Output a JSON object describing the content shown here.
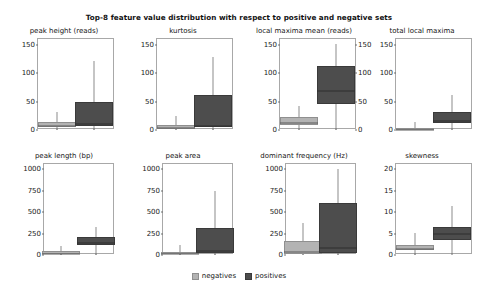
{
  "chart_data": {
    "type": "box",
    "title": "Top-8 feature value distribution with respect to positive and negative sets",
    "legend": {
      "position": "bottom-center",
      "entries": [
        {
          "label": "negatives",
          "color": "#b3b3b3"
        },
        {
          "label": "positives",
          "color": "#4d4d4d"
        }
      ]
    },
    "grid": false,
    "categories": [
      "negatives",
      "positives"
    ],
    "panels": [
      {
        "id": "peak-height",
        "title": "peak height (reads)",
        "ylabel": "",
        "ylim": [
          0,
          160
        ],
        "yticks": [
          0,
          50,
          100,
          150
        ],
        "ytick_labels": [
          "0",
          "50",
          "100",
          "150"
        ],
        "ytick_side": "left",
        "boxes": [
          {
            "group": "negatives",
            "q1": 5,
            "median": 9,
            "q3": 14,
            "whisker_low": 0,
            "whisker_high": 32
          },
          {
            "group": "positives",
            "q1": 7,
            "median": 12,
            "q3": 50,
            "whisker_low": 0,
            "whisker_high": 122
          }
        ]
      },
      {
        "id": "kurtosis",
        "title": "kurtosis",
        "ylabel": "",
        "ylim": [
          0,
          160
        ],
        "yticks": [
          0,
          50,
          100,
          150
        ],
        "ytick_labels": [
          "0",
          "50",
          "100",
          "150"
        ],
        "ytick_side": "left",
        "boxes": [
          {
            "group": "negatives",
            "q1": 2,
            "median": 5,
            "q3": 9,
            "whisker_low": 0,
            "whisker_high": 24
          },
          {
            "group": "positives",
            "q1": 5,
            "median": 9,
            "q3": 62,
            "whisker_low": 0,
            "whisker_high": 128
          }
        ]
      },
      {
        "id": "local-maxima-mean",
        "title": "local maxima mean (reads)",
        "ylabel": "",
        "ylim": [
          0,
          160
        ],
        "yticks": [
          0,
          50,
          100,
          150
        ],
        "ytick_labels": [
          "0",
          "50",
          "100",
          "150"
        ],
        "ytick_side": "both",
        "boxes": [
          {
            "group": "negatives",
            "q1": 8,
            "median": 14,
            "q3": 22,
            "whisker_low": 0,
            "whisker_high": 42
          },
          {
            "group": "positives",
            "q1": 46,
            "median": 70,
            "q3": 112,
            "whisker_low": 0,
            "whisker_high": 152
          }
        ]
      },
      {
        "id": "total-local-maxima",
        "title": "total local maxima",
        "ylabel": "",
        "ylim": [
          0,
          160
        ],
        "yticks": [
          0,
          50,
          100,
          150
        ],
        "ytick_labels": [
          "0",
          "50",
          "100",
          "150"
        ],
        "ytick_side": "left",
        "boxes": [
          {
            "group": "negatives",
            "q1": 1,
            "median": 2,
            "q3": 4,
            "whisker_low": 0,
            "whisker_high": 14
          },
          {
            "group": "positives",
            "q1": 12,
            "median": 18,
            "q3": 31,
            "whisker_low": 0,
            "whisker_high": 62
          }
        ]
      },
      {
        "id": "peak-length",
        "title": "peak length (bp)",
        "ylabel": "",
        "ylim": [
          0,
          1060
        ],
        "yticks": [
          0,
          250,
          500,
          750,
          1000
        ],
        "ytick_labels": [
          "0",
          "250",
          "500",
          "750",
          "1000"
        ],
        "ytick_side": "left",
        "boxes": [
          {
            "group": "negatives",
            "q1": 10,
            "median": 25,
            "q3": 42,
            "whisker_low": 0,
            "whisker_high": 110
          },
          {
            "group": "positives",
            "q1": 120,
            "median": 150,
            "q3": 205,
            "whisker_low": 0,
            "whisker_high": 330
          }
        ]
      },
      {
        "id": "peak-area",
        "title": "peak area",
        "ylabel": "",
        "ylim": [
          0,
          1060
        ],
        "yticks": [
          0,
          250,
          500,
          750,
          1000
        ],
        "ytick_labels": [
          "0",
          "250",
          "500",
          "750",
          "1000"
        ],
        "ytick_side": "left",
        "boxes": [
          {
            "group": "negatives",
            "q1": 8,
            "median": 20,
            "q3": 40,
            "whisker_low": 0,
            "whisker_high": 120
          },
          {
            "group": "positives",
            "q1": 20,
            "median": 55,
            "q3": 320,
            "whisker_low": 0,
            "whisker_high": 740
          }
        ]
      },
      {
        "id": "dominant-frequency",
        "title": "dominant frequency (Hz)",
        "ylabel": "",
        "ylim": [
          0,
          1060
        ],
        "yticks": [
          0,
          250,
          500,
          750,
          1000
        ],
        "ytick_labels": [
          "0",
          "250",
          "500",
          "750",
          "1000"
        ],
        "ytick_side": "left",
        "boxes": [
          {
            "group": "negatives",
            "q1": 10,
            "median": 45,
            "q3": 160,
            "whisker_low": 0,
            "whisker_high": 370
          },
          {
            "group": "positives",
            "q1": 20,
            "median": 90,
            "q3": 600,
            "whisker_low": 0,
            "whisker_high": 1000
          }
        ]
      },
      {
        "id": "skewness",
        "title": "skewness",
        "ylabel": "",
        "ylim": [
          0,
          21.2
        ],
        "yticks": [
          0,
          5,
          10,
          15,
          20
        ],
        "ytick_labels": [
          "0",
          "5",
          "10",
          "15",
          "20"
        ],
        "ytick_side": "left",
        "boxes": [
          {
            "group": "negatives",
            "q1": 1.1,
            "median": 1.7,
            "q3": 2.4,
            "whisker_low": 0,
            "whisker_high": 5.2
          },
          {
            "group": "positives",
            "q1": 3.6,
            "median": 5.2,
            "q3": 6.6,
            "whisker_low": 0.4,
            "whisker_high": 11.4
          }
        ]
      }
    ]
  }
}
